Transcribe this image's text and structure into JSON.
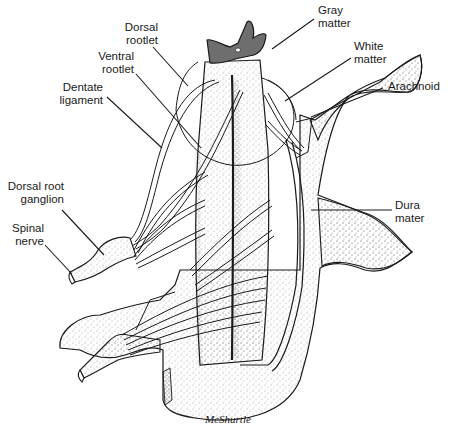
{
  "figure": {
    "labels": {
      "gray_matter": {
        "line1": "Gray",
        "line2": "matter"
      },
      "dorsal_rootlet": {
        "line1": "Dorsal",
        "line2": "rootlet"
      },
      "white_matter": {
        "line1": "White",
        "line2": "matter"
      },
      "ventral_rootlet": {
        "line1": "Ventral",
        "line2": "rootlet"
      },
      "arachnoid": {
        "line1": "Arachnoid"
      },
      "dentate_ligament": {
        "line1": "Dentate",
        "line2": "ligament"
      },
      "dorsal_root_ganglion": {
        "line1": "Dorsal root",
        "line2": "ganglion"
      },
      "spinal_nerve": {
        "line1": "Spinal",
        "line2": "nerve"
      },
      "dura_mater": {
        "line1": "Dura",
        "line2": "mater"
      }
    },
    "signature": "McShurtle",
    "colors": {
      "ink": "#1a1a1a",
      "gray_matter_fill": "#6e6e6e",
      "stipple": "#444444",
      "background": "#ffffff"
    }
  }
}
